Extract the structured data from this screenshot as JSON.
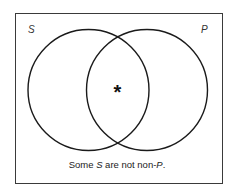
{
  "diagram": {
    "type": "venn",
    "sets": [
      {
        "name": "S",
        "label": "S",
        "center": [
          88,
          90
        ],
        "radius": 60
      },
      {
        "name": "P",
        "label": "P",
        "center": [
          147,
          90
        ],
        "radius": 60
      }
    ],
    "marker": {
      "symbol": "*",
      "region": "S ∩ P",
      "meaning": "at least one member exists"
    },
    "caption": {
      "prefix": "Some ",
      "subject": "S",
      "middle": " are not non-",
      "predicate": "P",
      "suffix": ".",
      "full_text": "Some S are not non-P."
    },
    "colors": {
      "stroke": "#1a1a1a",
      "frame": "#3a3a3a",
      "background": "#ffffff"
    }
  }
}
